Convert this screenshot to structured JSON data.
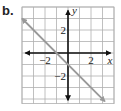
{
  "label": "b.",
  "chart_data": {
    "type": "line",
    "title": "",
    "xlabel": "x",
    "ylabel": "y",
    "xlim": [
      -4,
      4
    ],
    "ylim": [
      -4.4,
      4
    ],
    "grid": true,
    "x_ticks_labeled": [
      -2,
      2
    ],
    "y_ticks_labeled": [
      2,
      -2
    ],
    "x_tick_labels": [
      "−2",
      "2"
    ],
    "y_tick_labels": [
      "2",
      "−2"
    ],
    "series": [
      {
        "name": "line",
        "equation": "y = -x - 1",
        "slope": -1,
        "y_intercept": -1,
        "x": [
          -4,
          3.2
        ],
        "y": [
          3,
          -4.2
        ],
        "arrows": "both",
        "color": "#999999"
      }
    ],
    "axis_color": "#111111",
    "grid_color": "#b0b0b0"
  }
}
